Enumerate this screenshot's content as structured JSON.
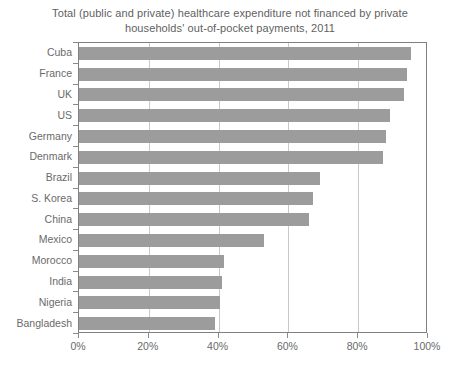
{
  "chart_data": {
    "type": "bar",
    "orientation": "horizontal",
    "title": "Total (public and private) healthcare expenditure not financed by private households' out-of-pocket payments, 2011",
    "title_line1": "Total (public and private) healthcare expenditure not financed by private",
    "title_line2": "households' out-of-pocket payments, 2011",
    "xlabel": "",
    "ylabel": "",
    "xlim": [
      0,
      100
    ],
    "grid": true,
    "grid_axis": "x",
    "legend": null,
    "bar_color": "#9c9c9c",
    "axis_color": "#808080",
    "grid_color": "#c9c9c9",
    "text_color": "#6a6a6a",
    "xticks": [
      "0%",
      "20%",
      "40%",
      "60%",
      "80%",
      "100%"
    ],
    "xtick_values": [
      0,
      20,
      40,
      60,
      80,
      100
    ],
    "categories": [
      "Cuba",
      "France",
      "UK",
      "US",
      "Germany",
      "Denmark",
      "Brazil",
      "S. Korea",
      "China",
      "Mexico",
      "Morocco",
      "India",
      "Nigeria",
      "Bangladesh"
    ],
    "values": [
      95,
      94,
      93,
      89,
      88,
      87,
      69,
      67,
      66,
      53,
      41.5,
      41,
      40.5,
      39
    ]
  }
}
